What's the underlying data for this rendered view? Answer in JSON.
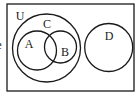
{
  "diagram": {
    "type": "venn",
    "edge_text": "e",
    "universe": {
      "label": "U",
      "rect": {
        "x": 7,
        "y": 4,
        "w": 127,
        "h": 87
      }
    },
    "sets": [
      {
        "label": "C",
        "cx": 46.5,
        "cy": 48,
        "r": 34
      },
      {
        "label": "A",
        "cx": 37,
        "cy": 50.5,
        "r": 19.5
      },
      {
        "label": "B",
        "cx": 60.5,
        "cy": 47,
        "r": 16
      },
      {
        "label": "D",
        "cx": 108.7,
        "cy": 47.5,
        "r": 24
      }
    ],
    "labels": {
      "U": "U",
      "C": "C",
      "A": "A",
      "B": "B",
      "D": "D"
    },
    "relationships": [
      "A is a subset of C",
      "B is a subset of C",
      "A and B intersect",
      "D is disjoint from C"
    ],
    "colors": {
      "stroke": "#1a1a1a",
      "background": "#ffffff"
    }
  }
}
